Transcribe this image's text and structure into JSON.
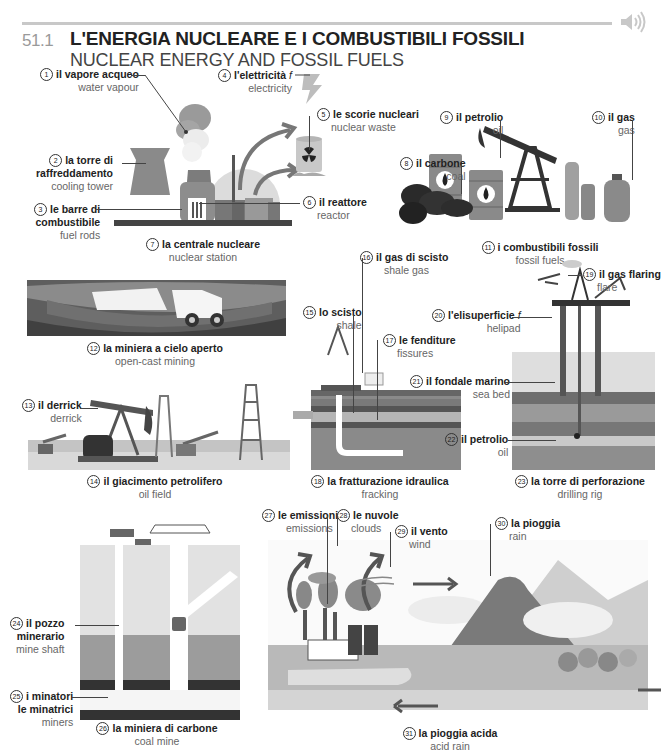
{
  "header": {
    "section_number": "51.1",
    "title_it": "L'ENERGIA NUCLEARE E I COMBUSTIBILI FOSSILI",
    "title_en": "NUCLEAR ENERGY AND FOSSIL FUELS",
    "audio_icon": "speaker-icon"
  },
  "labels": [
    {
      "n": "1",
      "it": "il vapore acqueo",
      "en": "water vapour"
    },
    {
      "n": "2",
      "it": "la torre di raffreddamento",
      "it_lines": [
        "la torre di",
        "raffreddamento"
      ],
      "en": "cooling tower"
    },
    {
      "n": "3",
      "it": "le barre di combustibile",
      "it_lines": [
        "le barre di",
        "combustibile"
      ],
      "en": "fuel rods"
    },
    {
      "n": "4",
      "it": "l'elettricità",
      "gender": "f",
      "en": "electricity"
    },
    {
      "n": "5",
      "it": "le scorie nucleari",
      "en": "nuclear waste"
    },
    {
      "n": "6",
      "it": "il reattore",
      "en": "reactor"
    },
    {
      "n": "7",
      "it": "la centrale nucleare",
      "en": "nuclear station"
    },
    {
      "n": "8",
      "it": "il carbone",
      "en": "coal"
    },
    {
      "n": "9",
      "it": "il petrolio",
      "en": "oil"
    },
    {
      "n": "10",
      "it": "il gas",
      "en": "gas"
    },
    {
      "n": "11",
      "it": "i combustibili fossili",
      "en": "fossil fuels"
    },
    {
      "n": "12",
      "it": "la miniera a cielo aperto",
      "en": "open-cast mining"
    },
    {
      "n": "13",
      "it": "il derrick",
      "en": "derrick"
    },
    {
      "n": "14",
      "it": "il giacimento petrolifero",
      "en": "oil field"
    },
    {
      "n": "15",
      "it": "lo scisto",
      "en": "shale"
    },
    {
      "n": "16",
      "it": "il gas di scisto",
      "en": "shale gas"
    },
    {
      "n": "17",
      "it": "le fenditure",
      "en": "fissures"
    },
    {
      "n": "18",
      "it": "la fratturazione idraulica",
      "en": "fracking"
    },
    {
      "n": "19",
      "it": "il gas flaring",
      "en": "flare"
    },
    {
      "n": "20",
      "it": "l'elisuperficie",
      "gender": "f",
      "en": "helipad"
    },
    {
      "n": "21",
      "it": "il fondale marino",
      "en": "sea bed"
    },
    {
      "n": "22",
      "it": "il petrolio",
      "en": "oil"
    },
    {
      "n": "23",
      "it": "la torre di perforazione",
      "en": "drilling rig"
    },
    {
      "n": "24",
      "it": "il pozzo minerario",
      "it_lines": [
        "il pozzo",
        "minerario"
      ],
      "en": "mine shaft"
    },
    {
      "n": "25",
      "it": "i minatori le minatrici",
      "it_lines": [
        "i minatori",
        "le minatrici"
      ],
      "en": "miners"
    },
    {
      "n": "26",
      "it": "la miniera di carbone",
      "en": "coal mine"
    },
    {
      "n": "27",
      "it": "le emissioni",
      "en": "emissions"
    },
    {
      "n": "28",
      "it": "le nuvole",
      "en": "clouds"
    },
    {
      "n": "29",
      "it": "il vento",
      "en": "wind"
    },
    {
      "n": "30",
      "it": "la pioggia",
      "en": "rain"
    },
    {
      "n": "31",
      "it": "la pioggia acida",
      "en": "acid rain"
    }
  ],
  "colors": {
    "ink": "#222222",
    "muted": "#666666",
    "rule": "#c8c8c8"
  }
}
